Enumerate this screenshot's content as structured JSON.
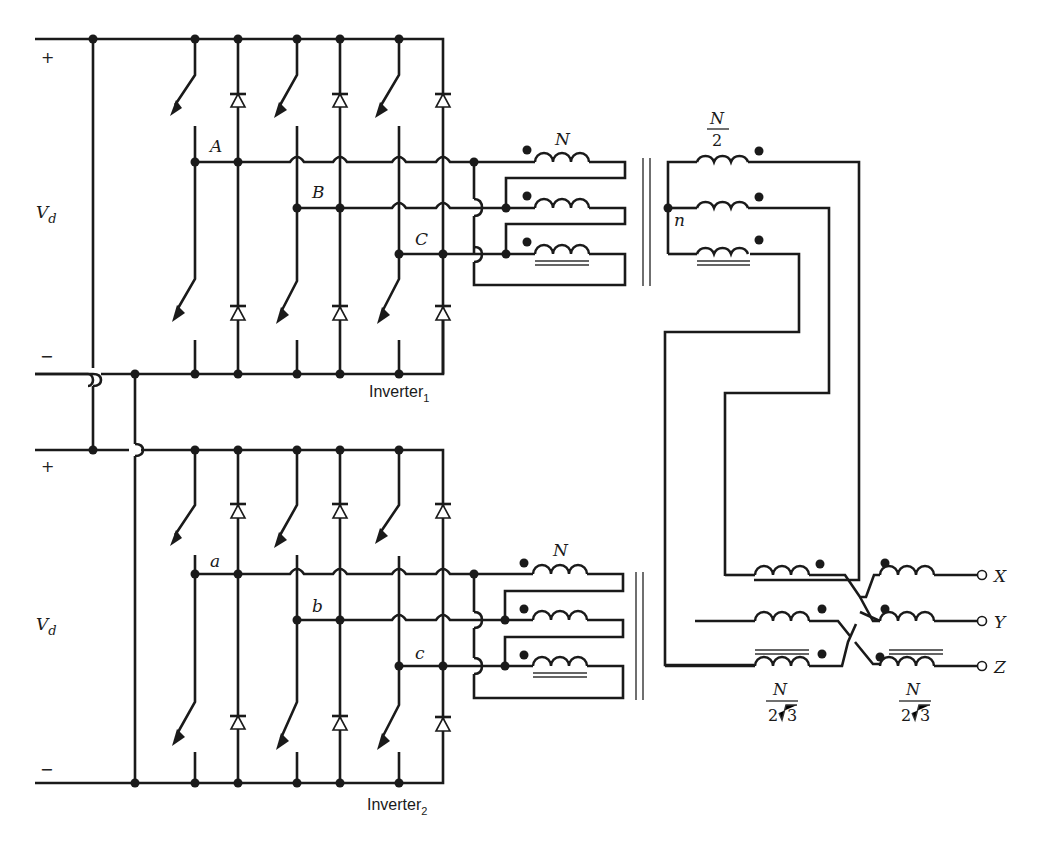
{
  "diagram": {
    "inverters": [
      {
        "name": "Inverter_1",
        "label": "Inverter",
        "subscript": "1",
        "dc_source": {
          "label": "V",
          "subscript": "d",
          "plus": "+",
          "minus": "−"
        },
        "phases": [
          "A",
          "B",
          "C"
        ],
        "transformer_primary_turns": "N",
        "transformer_secondary_turns": {
          "num": "N",
          "den": "2"
        },
        "neutral_label": "n"
      },
      {
        "name": "Inverter_2",
        "label": "Inverter",
        "subscript": "2",
        "dc_source": {
          "label": "V",
          "subscript": "d",
          "plus": "+",
          "minus": "−"
        },
        "phases": [
          "a",
          "b",
          "c"
        ],
        "transformer_primary_turns": "N"
      }
    ],
    "output_windings": [
      {
        "num": "N",
        "den_coef": "2",
        "den_rad": "3"
      },
      {
        "num": "N",
        "den_coef": "2",
        "den_rad": "3"
      }
    ],
    "outputs": [
      "X",
      "Y",
      "Z"
    ]
  }
}
